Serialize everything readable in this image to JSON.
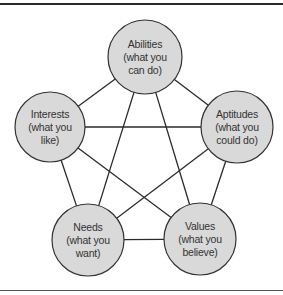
{
  "diagram": {
    "type": "complete-graph",
    "colors": {
      "node_fill": "#d9d9d9",
      "node_stroke": "#333333",
      "edge": "#2a2a2a"
    },
    "nodes": [
      {
        "id": "abilities",
        "title": "Abilities",
        "line2": "(what you",
        "line3": "can do)",
        "cx": 145,
        "cy": 57,
        "r": 37
      },
      {
        "id": "interests",
        "title": "Interests",
        "line2": "(what you",
        "line3": "like)",
        "cx": 50,
        "cy": 127,
        "r": 35
      },
      {
        "id": "aptitudes",
        "title": "Aptitudes",
        "line2": "(what you",
        "line3": "could do)",
        "cx": 237,
        "cy": 127,
        "r": 36
      },
      {
        "id": "needs",
        "title": "Needs",
        "line2": "(what you",
        "line3": "want)",
        "cx": 88,
        "cy": 240,
        "r": 36
      },
      {
        "id": "values",
        "title": "Values",
        "line2": "(what you",
        "line3": "believe)",
        "cx": 200,
        "cy": 239,
        "r": 36
      }
    ],
    "edges": [
      [
        "abilities",
        "interests"
      ],
      [
        "abilities",
        "aptitudes"
      ],
      [
        "abilities",
        "needs"
      ],
      [
        "abilities",
        "values"
      ],
      [
        "interests",
        "aptitudes"
      ],
      [
        "interests",
        "needs"
      ],
      [
        "interests",
        "values"
      ],
      [
        "aptitudes",
        "needs"
      ],
      [
        "aptitudes",
        "values"
      ],
      [
        "needs",
        "values"
      ]
    ]
  }
}
